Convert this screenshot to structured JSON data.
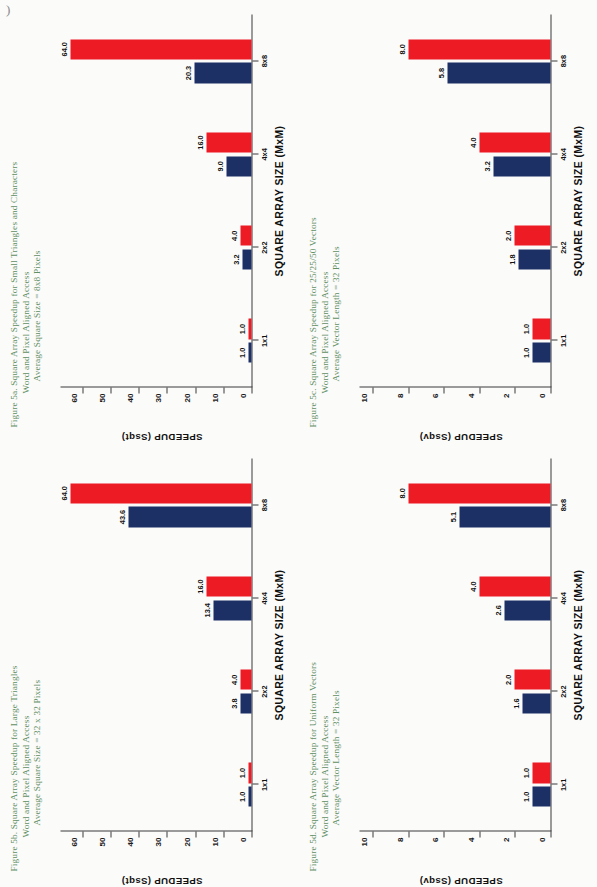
{
  "page": {
    "corner_mark": ")",
    "axis_x_title": "SQUARE ARRAY SIZE (MxM)",
    "categories": [
      "1x1",
      "2x2",
      "4x4",
      "8x8"
    ],
    "series_names": [
      "Word Aligned Access",
      "Pixel Aligned Access"
    ],
    "colors": {
      "word_aligned": "#1d3065",
      "pixel_aligned": "#ed1b24",
      "caption": "#5f8f63",
      "axis": "#3b3b3b",
      "background": "#fbfbfa"
    }
  },
  "charts": [
    {
      "id": "figure-5a",
      "caption_line1": "Figure 5a. Square Array Speedup for Small Triangles and Characters",
      "caption_line2": "Word and Pixel Aligned Access",
      "caption_line3": "Average Square Size = 8x8 Pixels",
      "ylabel": "SPEEDUP (Ssqt)",
      "xlabel": "SQUARE ARRAY SIZE (MxM)",
      "yticks": [
        "0",
        "10",
        "20",
        "30",
        "40",
        "50",
        "60"
      ],
      "ymax": 68,
      "categories": [
        "1x1",
        "2x2",
        "4x4",
        "8x8"
      ],
      "word_values": [
        1.0,
        3.2,
        9.0,
        20.3
      ],
      "pixel_values": [
        1.0,
        4.0,
        16.0,
        64.0
      ],
      "word_labels": [
        "1.0",
        "3.2",
        "9.0",
        "20.3"
      ],
      "pixel_labels": [
        "1.0",
        "4.0",
        "16.0",
        "64.0"
      ]
    },
    {
      "id": "figure-5b",
      "caption_line1": "Figure 5b. Square Array Speedup for Large Triangles",
      "caption_line2": "Word and Pixel Aligned Access",
      "caption_line3": "Average Square Size = 32 x 32 Pixels",
      "ylabel": "SPEEDUP (Ssqt)",
      "xlabel": "SQUARE ARRAY SIZE (MxM)",
      "yticks": [
        "0",
        "10",
        "20",
        "30",
        "40",
        "50",
        "60"
      ],
      "ymax": 68,
      "categories": [
        "1x1",
        "2x2",
        "4x4",
        "8x8"
      ],
      "word_values": [
        1.0,
        3.8,
        13.4,
        43.6
      ],
      "pixel_values": [
        1.0,
        4.0,
        16.0,
        64.0
      ],
      "word_labels": [
        "1.0",
        "3.8",
        "13.4",
        "43.6"
      ],
      "pixel_labels": [
        "1.0",
        "4.0",
        "16.0",
        "64.0"
      ]
    },
    {
      "id": "figure-5c",
      "caption_line1": "Figure 5c. Square Array Speedup for 25/25/50 Vectors",
      "caption_line2": "Word and Pixel Aligned Access",
      "caption_line3": "Average Vector Length = 32 Pixels",
      "ylabel": "SPEEDUP (Ssqv)",
      "xlabel": "SQUARE ARRAY SIZE (MxM)",
      "yticks": [
        "0",
        "2",
        "4",
        "6",
        "8",
        "10"
      ],
      "ymax": 10.8,
      "categories": [
        "1x1",
        "2x2",
        "4x4",
        "8x8"
      ],
      "word_values": [
        1.0,
        1.8,
        3.2,
        5.8
      ],
      "pixel_values": [
        1.0,
        2.0,
        4.0,
        8.0
      ],
      "word_labels": [
        "1.0",
        "1.8",
        "3.2",
        "5.8"
      ],
      "pixel_labels": [
        "1.0",
        "2.0",
        "4.0",
        "8.0"
      ]
    },
    {
      "id": "figure-5d",
      "caption_line1": "Figure 5d. Square Array Speedup for Uniform Vectors",
      "caption_line2": "Word and Pixel Aligned Access",
      "caption_line3": "Average Vector Length = 32 Pixels",
      "ylabel": "SPEEDUP (Ssqv)",
      "xlabel": "SQUARE ARRAY SIZE (MxM)",
      "yticks": [
        "0",
        "2",
        "4",
        "6",
        "8",
        "10"
      ],
      "ymax": 10.8,
      "categories": [
        "1x1",
        "2x2",
        "4x4",
        "8x8"
      ],
      "word_values": [
        1.0,
        1.6,
        2.6,
        5.1
      ],
      "pixel_values": [
        1.0,
        2.0,
        4.0,
        8.0
      ],
      "word_labels": [
        "1.0",
        "1.6",
        "2.6",
        "5.1"
      ],
      "pixel_labels": [
        "1.0",
        "2.0",
        "4.0",
        "8.0"
      ]
    }
  ],
  "chart_data": [
    {
      "type": "bar",
      "title": "Figure 5a. Square Array Speedup for Small Triangles and Characters",
      "subtitle": "Word and Pixel Aligned Access / Average Square Size = 8x8 Pixels",
      "xlabel": "SQUARE ARRAY SIZE (MxM)",
      "ylabel": "SPEEDUP (Ssqt)",
      "categories": [
        "1x1",
        "2x2",
        "4x4",
        "8x8"
      ],
      "series": [
        {
          "name": "Word Aligned Access",
          "values": [
            1.0,
            3.2,
            9.0,
            20.3
          ],
          "color": "#1d3065"
        },
        {
          "name": "Pixel Aligned Access",
          "values": [
            1.0,
            4.0,
            16.0,
            64.0
          ],
          "color": "#ed1b24"
        }
      ],
      "ylim": [
        0,
        68
      ],
      "yticks": [
        0,
        10,
        20,
        30,
        40,
        50,
        60
      ],
      "grid": false,
      "legend": "none"
    },
    {
      "type": "bar",
      "title": "Figure 5b. Square Array Speedup for Large Triangles",
      "subtitle": "Word and Pixel Aligned Access / Average Square Size = 32 x 32 Pixels",
      "xlabel": "SQUARE ARRAY SIZE (MxM)",
      "ylabel": "SPEEDUP (Ssqt)",
      "categories": [
        "1x1",
        "2x2",
        "4x4",
        "8x8"
      ],
      "series": [
        {
          "name": "Word Aligned Access",
          "values": [
            1.0,
            3.8,
            13.4,
            43.6
          ],
          "color": "#1d3065"
        },
        {
          "name": "Pixel Aligned Access",
          "values": [
            1.0,
            4.0,
            16.0,
            64.0
          ],
          "color": "#ed1b24"
        }
      ],
      "ylim": [
        0,
        68
      ],
      "yticks": [
        0,
        10,
        20,
        30,
        40,
        50,
        60
      ],
      "grid": false,
      "legend": "none"
    },
    {
      "type": "bar",
      "title": "Figure 5c. Square Array Speedup for 25/25/50 Vectors",
      "subtitle": "Word and Pixel Aligned Access / Average Vector Length = 32 Pixels",
      "xlabel": "SQUARE ARRAY SIZE (MxM)",
      "ylabel": "SPEEDUP (Ssqv)",
      "categories": [
        "1x1",
        "2x2",
        "4x4",
        "8x8"
      ],
      "series": [
        {
          "name": "Word Aligned Access",
          "values": [
            1.0,
            1.8,
            3.2,
            5.8
          ],
          "color": "#1d3065"
        },
        {
          "name": "Pixel Aligned Access",
          "values": [
            1.0,
            2.0,
            4.0,
            8.0
          ],
          "color": "#ed1b24"
        }
      ],
      "ylim": [
        0,
        10.8
      ],
      "yticks": [
        0,
        2,
        4,
        6,
        8,
        10
      ],
      "grid": false,
      "legend": "none"
    },
    {
      "type": "bar",
      "title": "Figure 5d. Square Array Speedup for Uniform Vectors",
      "subtitle": "Word and Pixel Aligned Access / Average Vector Length = 32 Pixels",
      "xlabel": "SQUARE ARRAY SIZE (MxM)",
      "ylabel": "SPEEDUP (Ssqv)",
      "categories": [
        "1x1",
        "2x2",
        "4x4",
        "8x8"
      ],
      "series": [
        {
          "name": "Word Aligned Access",
          "values": [
            1.0,
            1.6,
            2.6,
            5.1
          ],
          "color": "#1d3065"
        },
        {
          "name": "Pixel Aligned Access",
          "values": [
            1.0,
            2.0,
            4.0,
            8.0
          ],
          "color": "#ed1b24"
        }
      ],
      "ylim": [
        0,
        10.8
      ],
      "yticks": [
        0,
        2,
        4,
        6,
        8,
        10
      ],
      "grid": false,
      "legend": "none"
    }
  ]
}
